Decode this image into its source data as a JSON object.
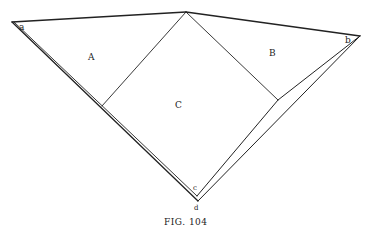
{
  "figure": {
    "caption": "FIG. 104",
    "labels": {
      "a": "a",
      "b": "b",
      "c": "c",
      "d": "d",
      "A": "A",
      "B": "B",
      "C": "C"
    },
    "points": {
      "a": [
        12,
        22
      ],
      "top": [
        186,
        12
      ],
      "b": [
        360,
        36
      ],
      "left_corner": [
        102,
        106
      ],
      "right_corner": [
        278,
        100
      ],
      "c": [
        197,
        196
      ],
      "d": [
        198,
        201
      ]
    },
    "stroke_color": "#222222",
    "background": "#ffffff"
  }
}
